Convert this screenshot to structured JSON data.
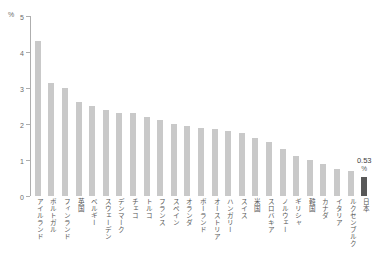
{
  "chart_data": {
    "type": "bar",
    "title": "",
    "subtitle": "",
    "xlabel": "",
    "ylabel": "",
    "unit_label": "%",
    "ylim": [
      0,
      5
    ],
    "yticks": [
      "0",
      "1",
      "2",
      "3",
      "4",
      "5"
    ],
    "grid": false,
    "legend": null,
    "categories": [
      "アイルランド",
      "ポルトガル",
      "フィンランド",
      "英国",
      "ベルギー",
      "スウェーデン",
      "デンマーク",
      "チェコ",
      "トルコ",
      "フランス",
      "スペイン",
      "オランダ",
      "ポーランド",
      "オーストリア",
      "ハンガリー",
      "スイス",
      "米国",
      "スロバキア",
      "ノルウェー",
      "ギリシャ",
      "韓国",
      "カナダ",
      "イタリア",
      "ルクセンブルク",
      "日本"
    ],
    "values": [
      4.3,
      3.15,
      3.0,
      2.6,
      2.5,
      2.4,
      2.3,
      2.3,
      2.2,
      2.1,
      2.0,
      1.95,
      1.9,
      1.85,
      1.8,
      1.75,
      1.6,
      1.5,
      1.3,
      1.1,
      1.0,
      0.9,
      0.75,
      0.7,
      0.53
    ],
    "highlight_index": 24,
    "annotations": [
      {
        "index": 24,
        "value_text": "0.53",
        "unit_text": "%"
      }
    ],
    "colors": {
      "bar": "#c9c9c9",
      "bar_highlight": "#585858",
      "axis": "#aeaeae",
      "tick_text": "#6b6b6b",
      "category_text": "#555555",
      "annotation_text": "#3d3d3d",
      "background": "#ffffff"
    }
  }
}
